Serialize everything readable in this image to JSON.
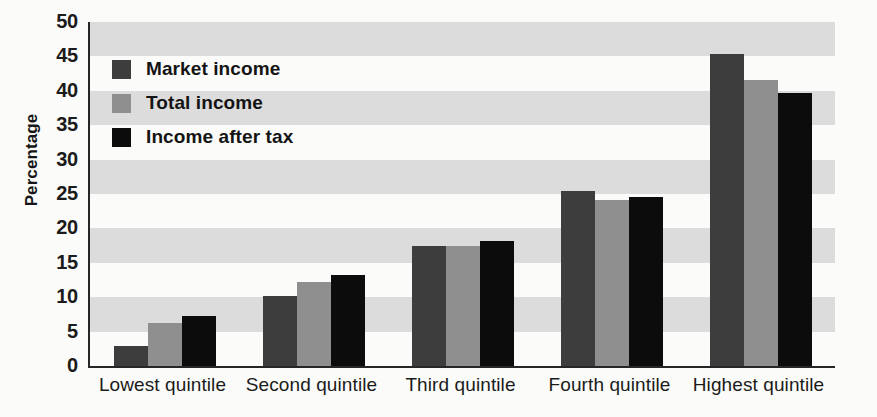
{
  "chart_data": {
    "type": "bar",
    "title": "",
    "xlabel": "",
    "ylabel": "Percentage",
    "ylim": [
      0,
      50
    ],
    "ytick_step": 5,
    "yticks": [
      "0",
      "5",
      "10",
      "15",
      "20",
      "25",
      "30",
      "35",
      "40",
      "45",
      "50"
    ],
    "grid": "horizontal-banding",
    "legend_position": "upper-left-inside",
    "categories": [
      "Lowest quintile",
      "Second quintile",
      "Third quintile",
      "Fourth quintile",
      "Highest quintile"
    ],
    "series": [
      {
        "name": "Market income",
        "color": "#3d3d3d",
        "values": [
          2.9,
          10.2,
          17.4,
          25.4,
          45.4
        ]
      },
      {
        "name": "Total income",
        "color": "#8f8f8f",
        "values": [
          6.3,
          12.2,
          17.4,
          24.2,
          41.5
        ]
      },
      {
        "name": "Income after tax",
        "color": "#0c0c0c",
        "values": [
          7.3,
          13.3,
          18.1,
          24.5,
          39.7
        ]
      }
    ]
  },
  "colors": {
    "band_gray": "#dcdcdc",
    "band_white": "#fbfbfa",
    "axis": "#262626",
    "text": "#1b1b1b"
  }
}
